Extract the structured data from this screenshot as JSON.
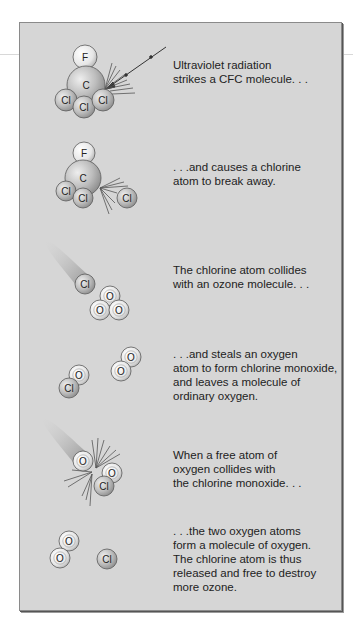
{
  "diagram": {
    "colors": {
      "panel_bg": "#d6d6d6",
      "panel_border": "#8a8a8a",
      "atom_light": "#f2f2f2",
      "atom_mid": "#bdbdbd",
      "atom_dark": "#8e8e8e",
      "trail": "#9a9a9a",
      "text": "#222222"
    },
    "steps": [
      {
        "caption": "Ultraviolet radiation\nstrikes a CFC molecule. . .",
        "atoms": [
          {
            "label": "F",
            "x": 85,
            "y": 57,
            "r": 12,
            "type": "light"
          },
          {
            "label": "C",
            "x": 86,
            "y": 85,
            "r": 19,
            "type": "mid"
          },
          {
            "label": "Cl",
            "x": 66,
            "y": 100,
            "r": 11,
            "type": "mid"
          },
          {
            "label": "Cl",
            "x": 84,
            "y": 107,
            "r": 11,
            "type": "mid"
          },
          {
            "label": "Cl",
            "x": 103,
            "y": 100,
            "r": 11,
            "type": "mid"
          }
        ]
      },
      {
        "caption": ". . .and causes a chlorine\natom to break away.",
        "atoms": [
          {
            "label": "F",
            "x": 84,
            "y": 153,
            "r": 11,
            "type": "light"
          },
          {
            "label": "C",
            "x": 83,
            "y": 178,
            "r": 18,
            "type": "mid"
          },
          {
            "label": "Cl",
            "x": 66,
            "y": 191,
            "r": 10,
            "type": "mid"
          },
          {
            "label": "Cl",
            "x": 83,
            "y": 198,
            "r": 10,
            "type": "mid"
          },
          {
            "label": "Cl",
            "x": 127,
            "y": 198,
            "r": 10,
            "type": "mid"
          }
        ]
      },
      {
        "caption": "The chlorine atom collides\nwith an ozone molecule. . .",
        "atoms": [
          {
            "label": "Cl",
            "x": 85,
            "y": 284,
            "r": 10,
            "type": "mid"
          },
          {
            "label": "O",
            "x": 110,
            "y": 296,
            "r": 10,
            "type": "light"
          },
          {
            "label": "O",
            "x": 100,
            "y": 310,
            "r": 10,
            "type": "light"
          },
          {
            "label": "O",
            "x": 119,
            "y": 310,
            "r": 10,
            "type": "light"
          }
        ]
      },
      {
        "caption": ". . .and steals an oxygen\natom to form chlorine monoxide,\nand leaves a molecule of\nordinary oxygen.",
        "atoms": [
          {
            "label": "O",
            "x": 79,
            "y": 375,
            "r": 10,
            "type": "light"
          },
          {
            "label": "Cl",
            "x": 69,
            "y": 388,
            "r": 10,
            "type": "mid"
          },
          {
            "label": "O",
            "x": 131,
            "y": 357,
            "r": 10,
            "type": "light"
          },
          {
            "label": "O",
            "x": 121,
            "y": 371,
            "r": 10,
            "type": "light"
          }
        ]
      },
      {
        "caption": "When a free atom of\noxygen collides with\nthe chlorine monoxide. . .",
        "atoms": [
          {
            "label": "O",
            "x": 83,
            "y": 461,
            "r": 10,
            "type": "light"
          },
          {
            "label": "O",
            "x": 112,
            "y": 473,
            "r": 10,
            "type": "light"
          },
          {
            "label": "Cl",
            "x": 104,
            "y": 486,
            "r": 10,
            "type": "mid"
          }
        ]
      },
      {
        "caption": ". . .the two oxygen atoms\nform a molecule of oxygen.\nThe chlorine atom is thus\nreleased and free to destroy\nmore ozone.",
        "atoms": [
          {
            "label": "O",
            "x": 69,
            "y": 541,
            "r": 10,
            "type": "light"
          },
          {
            "label": "O",
            "x": 60,
            "y": 558,
            "r": 10,
            "type": "light"
          },
          {
            "label": "Cl",
            "x": 107,
            "y": 559,
            "r": 10,
            "type": "mid"
          }
        ]
      }
    ]
  }
}
